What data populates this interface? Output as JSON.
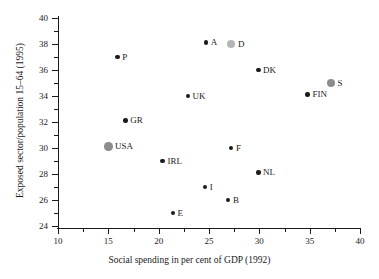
{
  "chart_data": {
    "type": "scatter",
    "title": "",
    "xlabel": "Social spending in per cent of GDP (1992)",
    "ylabel": "Exposed sector/population 15–64 (1995)",
    "xlim": [
      10,
      40
    ],
    "ylim": [
      23,
      40
    ],
    "xticks": [
      10,
      15,
      20,
      25,
      30,
      35,
      40
    ],
    "xtick_labels": [
      "10",
      "15",
      "20",
      "25",
      "30",
      "35",
      "40"
    ],
    "yticks": [
      24,
      26,
      28,
      30,
      32,
      34,
      36,
      38,
      40
    ],
    "ytick_labels": [
      "24",
      "26",
      "28",
      "30",
      "32",
      "34",
      "36",
      "38",
      "40"
    ],
    "grid": false,
    "legend": "none",
    "points": [
      {
        "label": "P",
        "x": 15.9,
        "y": 37.0,
        "color": "#1a1a1a",
        "size": 4.5,
        "label_pos": "right"
      },
      {
        "label": "GR",
        "x": 16.7,
        "y": 32.1,
        "color": "#1a1a1a",
        "size": 4.5,
        "label_pos": "right"
      },
      {
        "label": "USA",
        "x": 15.0,
        "y": 30.1,
        "color": "#8c8c8c",
        "size": 8.5,
        "label_pos": "right"
      },
      {
        "label": "A",
        "x": 24.7,
        "y": 38.1,
        "color": "#1a1a1a",
        "size": 4.5,
        "label_pos": "right"
      },
      {
        "label": "D",
        "x": 27.2,
        "y": 38.0,
        "color": "#b5b5b5",
        "size": 8.5,
        "label_pos": "right"
      },
      {
        "label": "DK",
        "x": 29.9,
        "y": 36.0,
        "color": "#1a1a1a",
        "size": 4.5,
        "label_pos": "right"
      },
      {
        "label": "S",
        "x": 37.1,
        "y": 35.0,
        "color": "#8c8c8c",
        "size": 8.5,
        "label_pos": "right"
      },
      {
        "label": "FIN",
        "x": 34.8,
        "y": 34.1,
        "color": "#1a1a1a",
        "size": 4.5,
        "label_pos": "right"
      },
      {
        "label": "UK",
        "x": 22.9,
        "y": 34.0,
        "color": "#1a1a1a",
        "size": 4.5,
        "label_pos": "right"
      },
      {
        "label": "F",
        "x": 27.2,
        "y": 30.0,
        "color": "#1a1a1a",
        "size": 4.5,
        "label_pos": "right"
      },
      {
        "label": "IRL",
        "x": 20.4,
        "y": 29.0,
        "color": "#1a1a1a",
        "size": 4.5,
        "label_pos": "right"
      },
      {
        "label": "NL",
        "x": 29.9,
        "y": 28.1,
        "color": "#1a1a1a",
        "size": 4.5,
        "label_pos": "right"
      },
      {
        "label": "I",
        "x": 24.6,
        "y": 27.0,
        "color": "#1a1a1a",
        "size": 4.5,
        "label_pos": "right"
      },
      {
        "label": "B",
        "x": 26.9,
        "y": 26.0,
        "color": "#1a1a1a",
        "size": 4.5,
        "label_pos": "right"
      },
      {
        "label": "E",
        "x": 21.4,
        "y": 25.0,
        "color": "#1a1a1a",
        "size": 4.5,
        "label_pos": "right"
      }
    ]
  },
  "axis": {
    "x_minor_ticks": [
      12.5,
      17.5,
      22.5,
      27.5,
      32.5,
      37.5
    ],
    "y_minor_ticks": [
      25,
      27,
      29,
      31,
      33,
      35,
      37,
      39
    ]
  }
}
